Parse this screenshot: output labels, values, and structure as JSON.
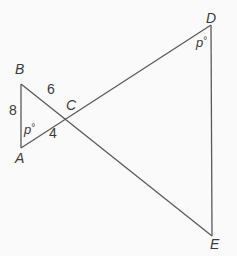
{
  "diagram": {
    "type": "geometry",
    "stroke_color": "#5a5a5a",
    "text_color": "#3a3a3a",
    "background": "#fafafa",
    "points": {
      "A": {
        "label": "A",
        "x": 21,
        "y": 148
      },
      "B": {
        "label": "B",
        "x": 21,
        "y": 84
      },
      "C": {
        "label": "C",
        "x": 72,
        "y": 117
      },
      "D": {
        "label": "D",
        "x": 211,
        "y": 25
      },
      "E": {
        "label": "E",
        "x": 212,
        "y": 236
      }
    },
    "segments": [
      {
        "from": "A",
        "to": "B"
      },
      {
        "from": "A",
        "to": "D"
      },
      {
        "from": "B",
        "to": "E"
      },
      {
        "from": "D",
        "to": "E"
      }
    ],
    "lengths": {
      "AB": "8",
      "BC": "6",
      "AC": "4"
    },
    "angles": {
      "A": {
        "var": "p",
        "unit": "°"
      },
      "D": {
        "var": "p",
        "unit": "°"
      }
    }
  }
}
